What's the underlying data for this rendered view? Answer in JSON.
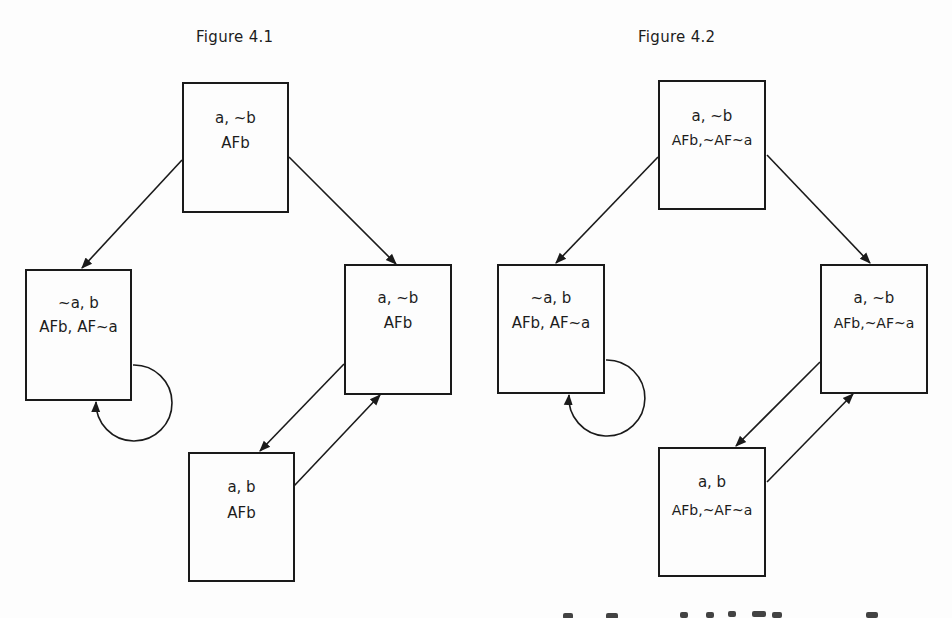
{
  "figures": [
    {
      "title": "Figure 4.1",
      "states": [
        {
          "id": "top",
          "line1": "a, ~b",
          "line2": "AFb"
        },
        {
          "id": "left",
          "line1": "~a, b",
          "line2": "AFb, AF~a"
        },
        {
          "id": "right",
          "line1": "a, ~b",
          "line2": "AFb"
        },
        {
          "id": "bottom",
          "line1": "a, b",
          "line2": "AFb"
        }
      ],
      "transitions": [
        {
          "from": "top",
          "to": "left"
        },
        {
          "from": "top",
          "to": "right"
        },
        {
          "from": "left",
          "to": "left"
        },
        {
          "from": "right",
          "to": "bottom"
        },
        {
          "from": "bottom",
          "to": "right"
        }
      ]
    },
    {
      "title": "Figure 4.2",
      "states": [
        {
          "id": "top",
          "line1": "a, ~b",
          "line2": "AFb,~AF~a"
        },
        {
          "id": "left",
          "line1": "~a, b",
          "line2": "AFb, AF~a"
        },
        {
          "id": "right",
          "line1": "a, ~b",
          "line2": "AFb,~AF~a"
        },
        {
          "id": "bottom",
          "line1": "a, b",
          "line2": "AFb,~AF~a"
        }
      ],
      "transitions": [
        {
          "from": "top",
          "to": "left"
        },
        {
          "from": "top",
          "to": "right"
        },
        {
          "from": "left",
          "to": "left"
        },
        {
          "from": "right",
          "to": "bottom"
        },
        {
          "from": "bottom",
          "to": "right"
        }
      ]
    }
  ],
  "colors": {
    "ink": "#1a1a1a",
    "paper": "#fdfdfd"
  }
}
